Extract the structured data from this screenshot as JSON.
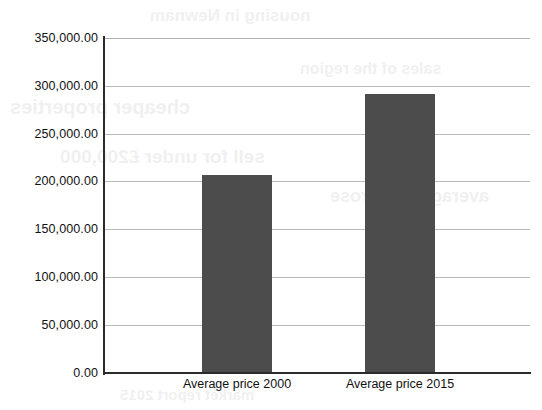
{
  "chart_data": {
    "type": "bar",
    "title": "",
    "subtitle": "",
    "xlabel": "",
    "ylabel": "",
    "categories": [
      "Average price 2000",
      "Average price 2015"
    ],
    "values": [
      207000,
      292000
    ],
    "value_labels": [
      "207,000.00",
      "292,000.00"
    ],
    "ylim": [
      0,
      350000
    ],
    "ytick_values": [
      0,
      50000,
      100000,
      150000,
      200000,
      250000,
      300000,
      350000
    ],
    "ytick_labels": [
      "0.00",
      "50,000.00",
      "100,000.00",
      "150,000.00",
      "200,000.00",
      "250,000.00",
      "300,000.00",
      "350,000.00"
    ],
    "grid": true,
    "grid_axis": "y",
    "legend": false,
    "legend_position": "none",
    "series": [
      {
        "name": "",
        "values": [
          207000,
          292000
        ],
        "color": "#4c4c4c"
      }
    ]
  },
  "style": {
    "bar_color": "#4c4c4c",
    "axis_color": "#2b2b2b",
    "grid_color": "#b9b9b9",
    "background": "#ffffff",
    "text_color": "#111111"
  },
  "bleed_through": {
    "lines": [
      "nousing in Newnam",
      "cheaper properties",
      "sales of the region",
      "sell for under £200,000",
      "average price rose",
      "market report 2015"
    ]
  }
}
